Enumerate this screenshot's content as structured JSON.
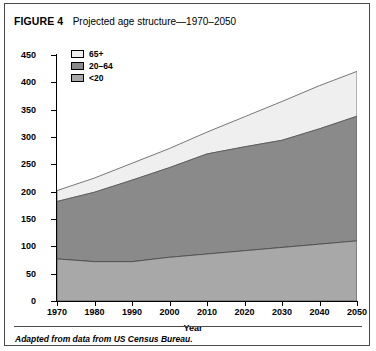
{
  "figure": {
    "label": "FIGURE 4",
    "title": "Projected age structure—1970–2050",
    "caption": "Adapted from data from US Census Bureau."
  },
  "legend": {
    "items": [
      {
        "label": "65+",
        "color": "#efefef"
      },
      {
        "label": "20–64",
        "color": "#8a8a8a"
      },
      {
        "label": "<20",
        "color": "#a8a8a8"
      }
    ]
  },
  "chart_data": {
    "type": "area",
    "stacked": true,
    "title": "Projected age structure—1970–2050",
    "xlabel": "Year",
    "ylabel": "Millions of People",
    "x": [
      1970,
      1980,
      1990,
      2000,
      2010,
      2020,
      2030,
      2040,
      2050
    ],
    "xlim": [
      1970,
      2050
    ],
    "ylim": [
      0,
      450
    ],
    "yticks": [
      0,
      50,
      100,
      150,
      200,
      250,
      300,
      350,
      400,
      450
    ],
    "xticks": [
      1970,
      1980,
      1990,
      2000,
      2010,
      2020,
      2030,
      2040,
      2050
    ],
    "grid": false,
    "legend_position": "upper-left",
    "series": [
      {
        "name": "<20",
        "values": [
          77,
          72,
          72,
          80,
          86,
          92,
          98,
          104,
          110
        ]
      },
      {
        "name": "20–64",
        "values": [
          105,
          127,
          149,
          164,
          183,
          190,
          196,
          211,
          228
        ]
      },
      {
        "name": "65+",
        "values": [
          20,
          26,
          31,
          35,
          40,
          55,
          71,
          79,
          82
        ]
      }
    ],
    "totals": [
      202,
      225,
      252,
      279,
      309,
      337,
      365,
      394,
      420
    ]
  },
  "axes": {
    "y_tick_labels": [
      "450",
      "400",
      "350",
      "300",
      "250",
      "200",
      "150",
      "100",
      "50",
      "0"
    ],
    "x_tick_labels": [
      "1970",
      "1980",
      "1990",
      "2000",
      "2010",
      "2020",
      "2030",
      "2040",
      "2050"
    ]
  }
}
